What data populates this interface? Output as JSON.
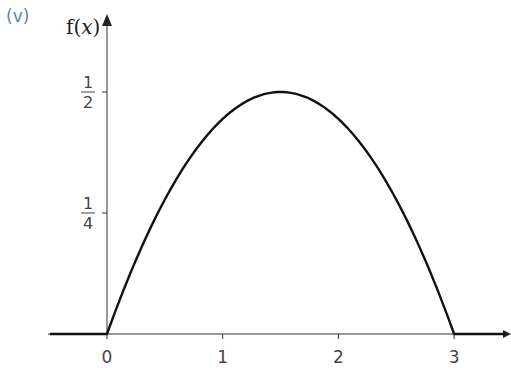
{
  "part_label": "(v)",
  "chart_data": {
    "type": "line",
    "title": "",
    "ylabel": "f(x)",
    "xlabel": "x",
    "function": "f(x) = (2/9) x (3 - x) for 0 <= x <= 3, else 0",
    "xlim": [
      -0.5,
      3.5
    ],
    "ylim": [
      0,
      0.65
    ],
    "x_ticks": [
      {
        "value": 0,
        "label": "0"
      },
      {
        "value": 1,
        "label": "1"
      },
      {
        "value": 2,
        "label": "2"
      },
      {
        "value": 3,
        "label": "3"
      }
    ],
    "y_ticks": [
      {
        "value": 0.25,
        "num": "1",
        "den": "4"
      },
      {
        "value": 0.5,
        "num": "1",
        "den": "2"
      }
    ],
    "series": [
      {
        "name": "f(x)",
        "x": [
          -0.5,
          0,
          0.25,
          0.5,
          0.75,
          1,
          1.25,
          1.5,
          1.75,
          2,
          2.25,
          2.5,
          2.75,
          3,
          3.5
        ],
        "y": [
          0,
          0,
          0.1528,
          0.2778,
          0.375,
          0.4444,
          0.4861,
          0.5,
          0.4861,
          0.4444,
          0.375,
          0.2778,
          0.1528,
          0,
          0
        ]
      }
    ],
    "grid": false,
    "legend": "none"
  }
}
